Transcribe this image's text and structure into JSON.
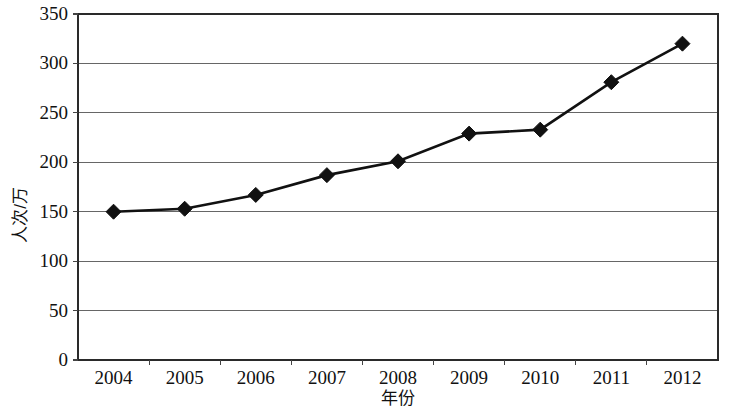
{
  "chart_data": {
    "type": "line",
    "title": "",
    "subtitle": "",
    "xlabel": "年份",
    "ylabel": "人次/万",
    "categories": [
      "2004",
      "2005",
      "2006",
      "2007",
      "2008",
      "2009",
      "2010",
      "2011",
      "2012"
    ],
    "x": [
      2004,
      2005,
      2006,
      2007,
      2008,
      2009,
      2010,
      2011,
      2012
    ],
    "values": [
      150,
      153,
      167,
      187,
      201,
      229,
      233,
      281,
      320
    ],
    "series": [
      {
        "name": "人次/万",
        "values": [
          150,
          153,
          167,
          187,
          201,
          229,
          233,
          281,
          320
        ],
        "marker": "diamond",
        "color": "#111111"
      }
    ],
    "ylim": [
      0,
      350
    ],
    "ytick_step": 50,
    "ytick_labels": [
      "0",
      "50",
      "100",
      "150",
      "200",
      "250",
      "300",
      "350"
    ],
    "ytick_values": [
      0,
      50,
      100,
      150,
      200,
      250,
      300,
      350
    ],
    "xtick_labels": [
      "2004",
      "2005",
      "2006",
      "2007",
      "2008",
      "2009",
      "2010",
      "2011",
      "2012"
    ],
    "grid": true,
    "grid_axis": "y",
    "legend": false,
    "legend_position": "none",
    "background_color": "#ffffff",
    "line_color": "#111111",
    "grid_color": "#666666",
    "frame_color": "#2a2a2a"
  },
  "axis": {
    "y_title": "人次/万",
    "x_title": "年份"
  }
}
